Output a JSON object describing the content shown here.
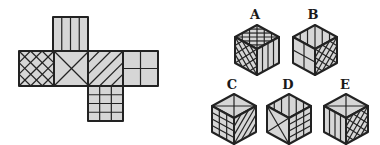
{
  "puzzle": {
    "type": "cube-net-folding",
    "colors": {
      "fill": "#d6d6d6",
      "stroke": "#222222",
      "background": "#ffffff"
    },
    "net": {
      "faces": [
        {
          "id": "top",
          "pattern": "vertical-stripes",
          "x": 53,
          "y": 17
        },
        {
          "id": "left",
          "pattern": "crosshatch-diagonal",
          "x": 19,
          "y": 51
        },
        {
          "id": "center",
          "pattern": "x-diagonals",
          "x": 54,
          "y": 51
        },
        {
          "id": "right",
          "pattern": "diagonal-stripes",
          "x": 88,
          "y": 51
        },
        {
          "id": "far-right",
          "pattern": "quarters",
          "x": 123,
          "y": 51
        },
        {
          "id": "bottom",
          "pattern": "grid-3x3",
          "x": 88,
          "y": 86
        }
      ],
      "size": 35
    },
    "options": [
      {
        "label": "A",
        "lx": 255,
        "ly": 14,
        "cx": 257,
        "cy": 25,
        "faces": {
          "top": "crosshatch-diagonal",
          "left": "crosshatch-diagonal",
          "right": "vertical-stripes"
        }
      },
      {
        "label": "B",
        "lx": 313,
        "ly": 14,
        "cx": 315,
        "cy": 25,
        "faces": {
          "top": "diagonal-stripes",
          "left": "quarters",
          "right": "crosshatch-diagonal"
        }
      },
      {
        "label": "C",
        "lx": 232,
        "ly": 84,
        "cx": 234,
        "cy": 94,
        "faces": {
          "top": "x-diagonals",
          "left": "grid-3x3",
          "right": "diagonal-stripes"
        }
      },
      {
        "label": "D",
        "lx": 288,
        "ly": 84,
        "cx": 289,
        "cy": 94,
        "faces": {
          "top": "diagonal-stripes",
          "left": "x-diagonals",
          "right": "grid-3x3"
        }
      },
      {
        "label": "E",
        "lx": 345,
        "ly": 84,
        "cx": 346,
        "cy": 94,
        "faces": {
          "top": "x-diagonals",
          "left": "vertical-stripes",
          "right": "crosshatch-diagonal"
        }
      }
    ]
  }
}
